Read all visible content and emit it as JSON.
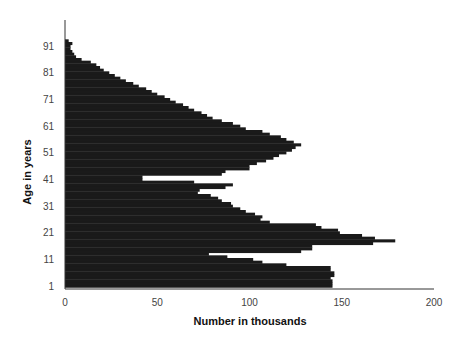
{
  "chart_data": {
    "type": "bar",
    "orientation": "horizontal",
    "title": "",
    "xlabel": "Number in thousands",
    "ylabel": "Age in years",
    "xlim": [
      0,
      200
    ],
    "ylim": [
      1,
      93
    ],
    "x_ticks": [
      0,
      50,
      100,
      150,
      200
    ],
    "y_ticks": [
      1,
      11,
      21,
      31,
      41,
      51,
      61,
      71,
      81,
      91
    ],
    "grid": false,
    "legend": null,
    "bar_color": "#1a1a1a",
    "categories": [
      1,
      2,
      3,
      4,
      5,
      6,
      7,
      8,
      9,
      10,
      11,
      12,
      13,
      14,
      15,
      16,
      17,
      18,
      19,
      20,
      21,
      22,
      23,
      24,
      25,
      26,
      27,
      28,
      29,
      30,
      31,
      32,
      33,
      34,
      35,
      36,
      37,
      38,
      39,
      40,
      41,
      42,
      43,
      44,
      45,
      46,
      47,
      48,
      49,
      50,
      51,
      52,
      53,
      54,
      55,
      56,
      57,
      58,
      59,
      60,
      61,
      62,
      63,
      64,
      65,
      66,
      67,
      68,
      69,
      70,
      71,
      72,
      73,
      74,
      75,
      76,
      77,
      78,
      79,
      80,
      81,
      82,
      83,
      84,
      85,
      86,
      87,
      88,
      89,
      90,
      91,
      92,
      93
    ],
    "values": [
      145,
      145,
      145,
      144,
      146,
      146,
      144,
      144,
      120,
      107,
      102,
      88,
      78,
      128,
      134,
      134,
      167,
      179,
      168,
      161,
      149,
      148,
      139,
      136,
      111,
      106,
      107,
      103,
      98,
      95,
      91,
      90,
      85,
      83,
      79,
      72,
      73,
      87,
      91,
      70,
      42,
      42,
      85,
      87,
      100,
      100,
      104,
      109,
      113,
      116,
      120,
      123,
      125,
      128,
      124,
      120,
      117,
      111,
      107,
      98,
      95,
      91,
      85,
      80,
      77,
      74,
      70,
      67,
      64,
      60,
      57,
      54,
      50,
      47,
      44,
      40,
      37,
      33,
      30,
      27,
      24,
      21,
      19,
      17,
      14,
      9,
      6,
      5,
      4,
      3,
      3,
      4,
      2
    ]
  },
  "axes": {
    "x_tick_labels": [
      "0",
      "50",
      "100",
      "150",
      "200"
    ],
    "y_tick_labels": [
      "1",
      "11",
      "21",
      "31",
      "41",
      "51",
      "61",
      "71",
      "81",
      "91"
    ],
    "x_title": "Number in thousands",
    "y_title": "Age in years"
  }
}
